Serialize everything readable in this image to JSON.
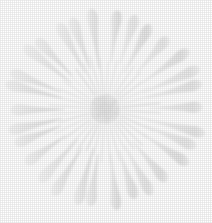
{
  "figure": {
    "title": "",
    "background_color": "#ffffff",
    "width": 212,
    "height": 223,
    "has_text": false,
    "has_axes": false,
    "has_border": false
  },
  "chart_data": {
    "type": "scatter",
    "title": "",
    "subtitle": "",
    "xlabel": "",
    "ylabel": "",
    "legend": [],
    "annotations": [],
    "grid": false,
    "legend_position": "none",
    "coordinate_system": "polar",
    "center": {
      "x": 105,
      "y": 109
    },
    "core": {
      "radius": 16,
      "fill": "#ededed",
      "mottled": true
    },
    "rays_inner": {
      "count": 36,
      "angle_step_deg": 10,
      "start_radius": 17,
      "end_radius": 56,
      "width_px": 1.1,
      "color": "#e9e9e9",
      "shape": "hairline-spoke"
    },
    "rays_outer": {
      "count": 30,
      "angle_step_deg": 12,
      "start_radius": 40,
      "end_radius": 104,
      "tail_width_px": 2,
      "bulb_width_px": 11,
      "bulb_position": 0.82,
      "color": "#e7e7e7",
      "shape": "club-comet-taper",
      "radius_jitter_px": 9,
      "angle_jitter_deg": 3
    },
    "ylim": [
      0,
      223
    ],
    "xlim": [
      0,
      212
    ],
    "palette": {
      "background": "#ffffff",
      "ray_light": "#f2f2f2",
      "ray_mid": "#e9e9e9",
      "ray_dark": "#e1e1e1",
      "core": "#ebebeb"
    }
  }
}
